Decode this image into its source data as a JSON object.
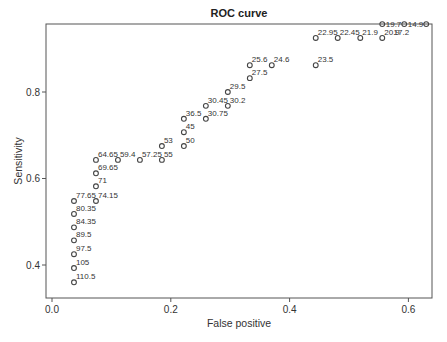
{
  "chart_data": {
    "type": "scatter",
    "title": "ROC curve",
    "xlabel": "False positive",
    "ylabel": "Sensitivity",
    "xlim": [
      -0.01,
      0.64
    ],
    "ylim": [
      0.35,
      0.98
    ],
    "grid": false,
    "legend": null,
    "xticks": [
      {
        "value": 0.0,
        "label": "0.0"
      },
      {
        "value": 0.2,
        "label": "0.2"
      },
      {
        "value": 0.4,
        "label": "0.4"
      },
      {
        "value": 0.6,
        "label": "0.6"
      }
    ],
    "yticks": [
      {
        "value": 0.4,
        "label": "0.4"
      },
      {
        "value": 0.6,
        "label": "0.6"
      },
      {
        "value": 0.8,
        "label": "0.8"
      }
    ],
    "points": [
      {
        "x": 0.037,
        "y": 0.36,
        "label": "110.5"
      },
      {
        "x": 0.037,
        "y": 0.393,
        "label": "105"
      },
      {
        "x": 0.037,
        "y": 0.425,
        "label": "97.5"
      },
      {
        "x": 0.037,
        "y": 0.457,
        "label": "89.5"
      },
      {
        "x": 0.037,
        "y": 0.487,
        "label": "84.35"
      },
      {
        "x": 0.037,
        "y": 0.518,
        "label": "80.35"
      },
      {
        "x": 0.037,
        "y": 0.548,
        "label": "77.65"
      },
      {
        "x": 0.074,
        "y": 0.548,
        "label": "74.15"
      },
      {
        "x": 0.074,
        "y": 0.582,
        "label": "71"
      },
      {
        "x": 0.074,
        "y": 0.612,
        "label": "69.65"
      },
      {
        "x": 0.074,
        "y": 0.643,
        "label": "64.65"
      },
      {
        "x": 0.111,
        "y": 0.643,
        "label": "59.4"
      },
      {
        "x": 0.148,
        "y": 0.643,
        "label": "57.25"
      },
      {
        "x": 0.185,
        "y": 0.643,
        "label": "55"
      },
      {
        "x": 0.185,
        "y": 0.675,
        "label": "53"
      },
      {
        "x": 0.222,
        "y": 0.675,
        "label": "50"
      },
      {
        "x": 0.222,
        "y": 0.707,
        "label": "45"
      },
      {
        "x": 0.222,
        "y": 0.738,
        "label": "36.5"
      },
      {
        "x": 0.259,
        "y": 0.738,
        "label": "30.75"
      },
      {
        "x": 0.259,
        "y": 0.768,
        "label": "30.45"
      },
      {
        "x": 0.296,
        "y": 0.768,
        "label": "30.2"
      },
      {
        "x": 0.296,
        "y": 0.8,
        "label": "29.5"
      },
      {
        "x": 0.333,
        "y": 0.832,
        "label": "27.5"
      },
      {
        "x": 0.333,
        "y": 0.862,
        "label": "25.6"
      },
      {
        "x": 0.37,
        "y": 0.862,
        "label": "24.6"
      },
      {
        "x": 0.444,
        "y": 0.862,
        "label": "23.5"
      },
      {
        "x": 0.444,
        "y": 0.925,
        "label": "22.95"
      },
      {
        "x": 0.481,
        "y": 0.925,
        "label": "22.45"
      },
      {
        "x": 0.519,
        "y": 0.925,
        "label": "21.9"
      },
      {
        "x": 0.556,
        "y": 0.925,
        "label": "20.9"
      },
      {
        "x": 0.556,
        "y": 0.957,
        "label": "19.7",
        "label_pos": "right-mid"
      },
      {
        "x": 0.593,
        "y": 0.957,
        "label": "14.9",
        "label_pos": "right-mid"
      },
      {
        "x": 0.63,
        "y": 0.957,
        "label": ""
      }
    ],
    "extra_labels": [
      {
        "x": 0.575,
        "y": 0.938,
        "text": "17.2"
      }
    ]
  },
  "layout": {
    "plot": {
      "left": 46,
      "top": 24,
      "right": 432,
      "bottom": 298
    },
    "marker_color": "#444444",
    "axis_color": "#555555"
  }
}
